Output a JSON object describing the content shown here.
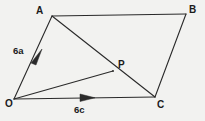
{
  "figure": {
    "background_color": "#f2f2f0",
    "stroke_color": "#2a2a2a",
    "text_color": "#1b1b1b",
    "width": 205,
    "height": 121,
    "vertices": [
      {
        "id": "A",
        "label": "A",
        "x": 52,
        "y": 16
      },
      {
        "id": "B",
        "label": "B",
        "x": 186,
        "y": 14
      },
      {
        "id": "C",
        "label": "C",
        "x": 155,
        "y": 97
      },
      {
        "id": "O",
        "label": "O",
        "x": 14,
        "y": 99
      },
      {
        "id": "P",
        "label": "P",
        "x": 113,
        "y": 71
      }
    ],
    "segments": [
      {
        "name": "segment-OA",
        "from": "O",
        "to": "A",
        "arrow": true,
        "label": "6a"
      },
      {
        "name": "segment-AB",
        "from": "A",
        "to": "B",
        "arrow": false,
        "label": ""
      },
      {
        "name": "segment-BC",
        "from": "B",
        "to": "C",
        "arrow": false,
        "label": ""
      },
      {
        "name": "segment-OC",
        "from": "O",
        "to": "C",
        "arrow": true,
        "label": "6c"
      },
      {
        "name": "segment-AC",
        "from": "A",
        "to": "C",
        "arrow": false,
        "label": ""
      },
      {
        "name": "segment-OP",
        "from": "O",
        "to": "P",
        "arrow": false,
        "label": ""
      }
    ],
    "vector_labels": [
      {
        "id": "6a",
        "text": "6a",
        "on": "segment-OA"
      },
      {
        "id": "6c",
        "text": "6c",
        "on": "segment-OC"
      }
    ],
    "points": {
      "A": "52,16",
      "B": "186,14",
      "C": "155,97",
      "O": "14,99",
      "P": "113,71"
    },
    "paths": {
      "OA": "M14,99 L52,16",
      "AB": "M52,16 L186,14",
      "BC": "M186,14 L155,97",
      "OC": "M14,99 L155,97",
      "AC": "M52,16 L155,97",
      "OP": "M14,99 L113,71"
    },
    "arrowheads": {
      "OA": "31,63 42,49 36,65",
      "OC": "80,94 95,97.8 80,101.5"
    }
  }
}
